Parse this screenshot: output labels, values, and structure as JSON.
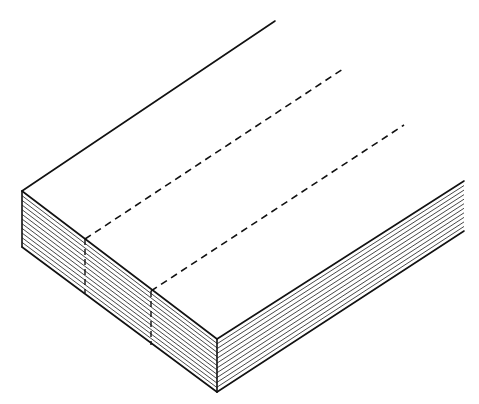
{
  "figure": {
    "stroke_color": "#111111",
    "background": "#ffffff",
    "geometry": {
      "top_back_left": [
        22,
        191
      ],
      "top_back_right_end": [
        275,
        21
      ],
      "front_corner_top": [
        217,
        339
      ],
      "front_corner_bottom": [
        217,
        392
      ],
      "left_bottom": [
        22,
        247
      ],
      "right_top": [
        464,
        181
      ],
      "right_bottom": [
        464,
        231
      ]
    },
    "fold_lines": [
      {
        "id": "fold-1",
        "top_start": [
          85,
          239
        ],
        "top_end": [
          343,
          69
        ],
        "bottom": [
          85,
          293
        ]
      },
      {
        "id": "fold-2",
        "top_start": [
          151,
          291
        ],
        "top_end": [
          404,
          125
        ],
        "bottom": [
          151,
          345
        ]
      }
    ],
    "left_face_sheets": 12,
    "right_face_sheets": 11
  }
}
